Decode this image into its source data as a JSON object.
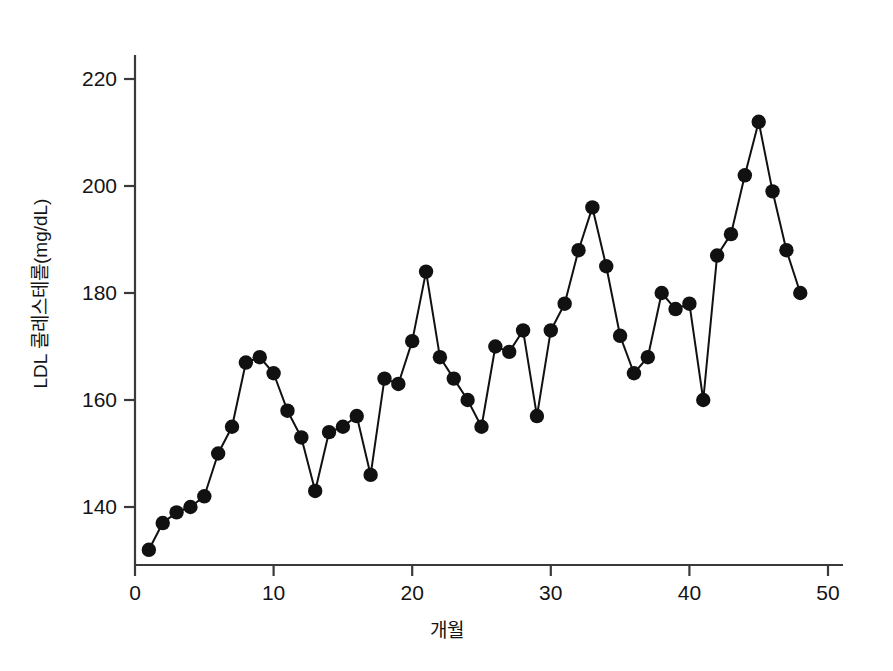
{
  "chart_data": {
    "type": "line",
    "title": "",
    "subtitle": "",
    "xlabel": "개월",
    "ylabel": "LDL 콜레스테롤(mg/dL)",
    "xlim": [
      0,
      51.5
    ],
    "ylim": [
      128,
      226
    ],
    "xticks": [
      0,
      10,
      20,
      30,
      40,
      50
    ],
    "xtick_labels": [
      "0",
      "10",
      "20",
      "30",
      "40",
      "50"
    ],
    "yticks": [
      140,
      160,
      180,
      200,
      220
    ],
    "ytick_labels": [
      "140",
      "160",
      "180",
      "200",
      "220"
    ],
    "grid": false,
    "legend": null,
    "legend_position": "none",
    "marker": "filled-circle",
    "marker_color": "#111111",
    "line_color": "#111111",
    "x": [
      1,
      2,
      3,
      4,
      5,
      6,
      7,
      8,
      9,
      10,
      11,
      12,
      13,
      14,
      15,
      16,
      17,
      18,
      19,
      20,
      21,
      22,
      23,
      24,
      25,
      26,
      27,
      28,
      29,
      30,
      31,
      32,
      33,
      34,
      35,
      36,
      37,
      38,
      39,
      40,
      41,
      42,
      43,
      44,
      45,
      46,
      47,
      48
    ],
    "values": [
      132,
      137,
      139,
      140,
      142,
      150,
      155,
      167,
      168,
      165,
      158,
      153,
      143,
      154,
      155,
      157,
      146,
      164,
      163,
      171,
      184,
      168,
      164,
      160,
      155,
      170,
      169,
      173,
      157,
      173,
      178,
      188,
      196,
      185,
      172,
      165,
      168,
      180,
      177,
      178,
      160,
      187,
      191,
      202,
      212,
      199,
      188,
      180
    ],
    "series": [
      {
        "name": "LDL 콜레스테롤",
        "values": [
          132,
          137,
          139,
          140,
          142,
          150,
          155,
          167,
          168,
          165,
          158,
          153,
          143,
          154,
          155,
          157,
          146,
          164,
          163,
          171,
          184,
          168,
          164,
          160,
          155,
          170,
          169,
          173,
          157,
          173,
          178,
          188,
          196,
          185,
          172,
          165,
          168,
          180,
          177,
          178,
          160,
          187,
          191,
          202,
          212,
          199,
          188,
          180
        ]
      }
    ]
  }
}
